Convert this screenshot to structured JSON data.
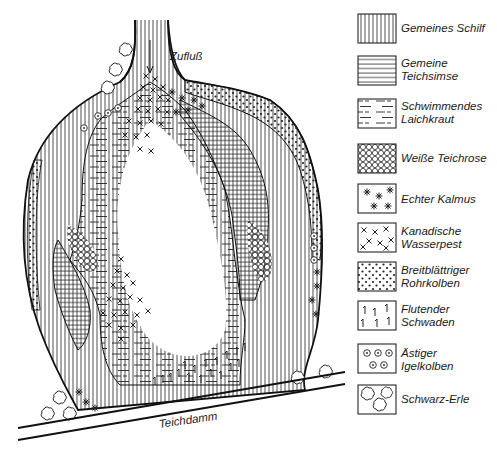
{
  "diagram": {
    "type": "pond vegetation zonation map",
    "labels": {
      "inflow": "Zufluß",
      "dam": "Teichdamm"
    },
    "legend": [
      {
        "key": "schilf",
        "pattern": "vertical-lines",
        "line1": "Gemeines Schilf",
        "line2": ""
      },
      {
        "key": "teichsimse",
        "pattern": "horizontal-lines",
        "line1": "Gemeine",
        "line2": "Teichsimse"
      },
      {
        "key": "laichkraut",
        "pattern": "broken-horizontal-dashes",
        "line1": "Schwimmendes",
        "line2": "Laichkraut"
      },
      {
        "key": "teichrose",
        "pattern": "small-circles",
        "line1": "Weiße Teichrose",
        "line2": ""
      },
      {
        "key": "kalmus",
        "pattern": "asterisks",
        "line1": "Echter Kalmus",
        "line2": ""
      },
      {
        "key": "wasserpest",
        "pattern": "crosses",
        "line1": "Kanadische",
        "line2": "Wasserpest"
      },
      {
        "key": "rohrkolben",
        "pattern": "dots",
        "line1": "Breitblättriger",
        "line2": "Rohrkolben"
      },
      {
        "key": "schwaden",
        "pattern": "hook-strokes",
        "line1": "Flutender",
        "line2": "Schwaden"
      },
      {
        "key": "igelkolben",
        "pattern": "dotted-circles",
        "line1": "Ästiger",
        "line2": "Igelkolben"
      },
      {
        "key": "erle",
        "pattern": "cloud-shapes",
        "line1": "Schwarz-Erle",
        "line2": ""
      }
    ]
  }
}
